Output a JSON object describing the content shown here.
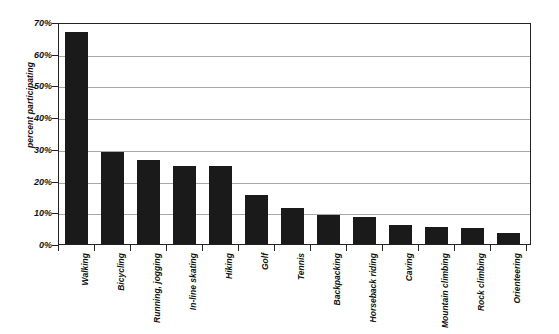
{
  "chart_data": {
    "type": "bar",
    "title": "",
    "xlabel": "",
    "ylabel": "percent participating",
    "ylim": [
      0,
      70
    ],
    "ytick_step": 10,
    "ytick_labels": [
      "0%",
      "10%",
      "20%",
      "30%",
      "40%",
      "50%",
      "60%",
      "70%"
    ],
    "ytick_values": [
      0,
      10,
      20,
      30,
      40,
      50,
      60,
      70
    ],
    "grid": "horizontal",
    "legend": "none",
    "bar_color": "#1a1a1a",
    "gridline_color": "#a8a8a8",
    "axis_color": "#222222",
    "background_color": "#ffffff",
    "categories": [
      "Walking",
      "Bicycling",
      "Running, jogging",
      "In-line skating",
      "Hiking",
      "Golf",
      "Tennis",
      "Backpacking",
      "Horseback riding",
      "Caving",
      "Mountain climbing",
      "Rock climbing",
      "Orienteering"
    ],
    "values": [
      67,
      29,
      26.5,
      24.5,
      24.5,
      15.5,
      11.5,
      9,
      8.5,
      6,
      5.5,
      5,
      3.5
    ]
  }
}
